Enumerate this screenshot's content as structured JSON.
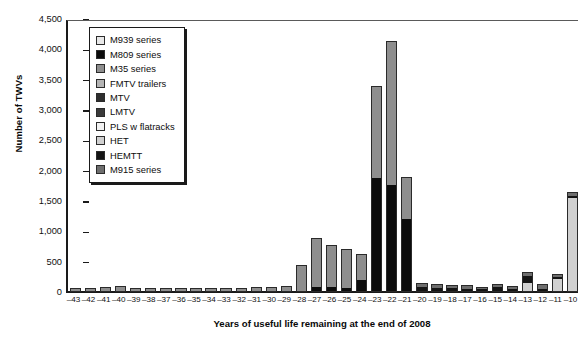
{
  "chart_data": {
    "type": "bar",
    "barmode": "stacked",
    "title": "",
    "xlabel": "Years of useful life remaining at the end of 2008",
    "ylabel": "Number of TWVs",
    "ylim": [
      0,
      4500
    ],
    "ytick_step": 500,
    "grid": false,
    "legend_position": "upper-left-inside",
    "ytick_labels": [
      "4,500",
      "4,000",
      "3,500",
      "3,000",
      "2,500",
      "2,000",
      "1,500",
      "1,000",
      "500",
      "0"
    ],
    "ytick_values": [
      4500,
      4000,
      3500,
      3000,
      2500,
      2000,
      1500,
      1000,
      500,
      0
    ],
    "categories": [
      "-43",
      "-42",
      "-41",
      "-40",
      "-39",
      "-38",
      "-37",
      "-36",
      "-35",
      "-34",
      "-33",
      "-32",
      "-31",
      "-30",
      "-29",
      "-28",
      "-27",
      "-26",
      "-25",
      "-24",
      "-23",
      "-22",
      "-21",
      "-20",
      "-19",
      "-18",
      "-17",
      "-16",
      "-15",
      "-14",
      "-13",
      "-12",
      "-11",
      "-10"
    ],
    "series": [
      {
        "name": "M939 series",
        "color": "#e8e8e8",
        "values": [
          0,
          0,
          0,
          0,
          0,
          0,
          0,
          0,
          0,
          0,
          0,
          0,
          0,
          0,
          0,
          0,
          0,
          0,
          0,
          0,
          0,
          0,
          0,
          0,
          0,
          0,
          0,
          0,
          0,
          0,
          0,
          0,
          0,
          0
        ]
      },
      {
        "name": "M809 series",
        "color": "#0c0c0c",
        "values": [
          0,
          0,
          0,
          0,
          0,
          0,
          0,
          0,
          0,
          0,
          0,
          0,
          0,
          0,
          0,
          0,
          60,
          60,
          50,
          180,
          1870,
          1740,
          1190,
          0,
          0,
          0,
          0,
          0,
          0,
          0,
          0,
          0,
          0,
          0
        ]
      },
      {
        "name": "M35 series",
        "color": "#8e8e8e",
        "values": [
          30,
          35,
          45,
          70,
          40,
          30,
          35,
          30,
          35,
          35,
          35,
          40,
          45,
          45,
          70,
          410,
          790,
          680,
          620,
          410,
          1500,
          2370,
          680,
          0,
          0,
          0,
          0,
          0,
          0,
          0,
          0,
          0,
          0,
          0
        ]
      },
      {
        "name": "FMTV trailers",
        "color": "#b4b4b4",
        "values": [
          0,
          0,
          0,
          0,
          0,
          0,
          0,
          0,
          0,
          0,
          0,
          0,
          0,
          0,
          0,
          0,
          0,
          0,
          0,
          0,
          0,
          0,
          0,
          0,
          0,
          0,
          0,
          0,
          0,
          0,
          0,
          0,
          0,
          0
        ]
      },
      {
        "name": "MTV",
        "color": "#2e2e2e",
        "values": [
          0,
          0,
          0,
          0,
          0,
          0,
          0,
          0,
          0,
          0,
          0,
          0,
          0,
          0,
          0,
          0,
          0,
          0,
          0,
          0,
          0,
          0,
          0,
          0,
          0,
          0,
          0,
          0,
          0,
          0,
          0,
          0,
          0,
          0
        ]
      },
      {
        "name": "LMTV",
        "color": "#3a3a3a",
        "values": [
          0,
          0,
          0,
          0,
          0,
          0,
          0,
          0,
          0,
          0,
          0,
          0,
          0,
          0,
          0,
          0,
          0,
          0,
          0,
          0,
          0,
          0,
          0,
          0,
          0,
          0,
          0,
          0,
          0,
          0,
          0,
          0,
          0,
          0
        ]
      },
      {
        "name": "PLS w flatracks",
        "color": "#f2f2f2",
        "values": [
          0,
          0,
          0,
          0,
          0,
          0,
          0,
          0,
          0,
          0,
          0,
          0,
          0,
          0,
          0,
          0,
          0,
          0,
          0,
          0,
          0,
          0,
          0,
          0,
          0,
          0,
          0,
          0,
          0,
          0,
          0,
          0,
          0,
          0
        ]
      },
      {
        "name": "HET",
        "color": "#d0d0d0",
        "values": [
          0,
          0,
          0,
          0,
          0,
          0,
          0,
          0,
          0,
          0,
          0,
          0,
          0,
          0,
          0,
          0,
          0,
          0,
          0,
          0,
          0,
          0,
          0,
          0,
          0,
          0,
          0,
          0,
          0,
          0,
          140,
          0,
          200,
          1530
        ]
      },
      {
        "name": "HEMTT",
        "color": "#141414",
        "values": [
          0,
          0,
          0,
          0,
          0,
          0,
          0,
          0,
          0,
          0,
          0,
          0,
          0,
          0,
          0,
          0,
          0,
          0,
          0,
          0,
          0,
          0,
          0,
          60,
          45,
          45,
          35,
          25,
          70,
          35,
          115,
          40,
          25,
          30
        ]
      },
      {
        "name": "M915 series",
        "color": "#6e6e6e",
        "values": [
          0,
          0,
          0,
          0,
          0,
          0,
          0,
          0,
          0,
          0,
          0,
          0,
          0,
          0,
          0,
          0,
          0,
          0,
          0,
          0,
          0,
          0,
          0,
          60,
          50,
          45,
          40,
          30,
          25,
          30,
          50,
          55,
          35,
          50
        ]
      }
    ],
    "legend_entries": [
      {
        "label": "M939 series",
        "color": "#e8e8e8"
      },
      {
        "label": "M809 series",
        "color": "#0c0c0c"
      },
      {
        "label": "M35 series",
        "color": "#8e8e8e"
      },
      {
        "label": "FMTV trailers",
        "color": "#b4b4b4"
      },
      {
        "label": "MTV",
        "color": "#2e2e2e"
      },
      {
        "label": "LMTV",
        "color": "#3a3a3a"
      },
      {
        "label": "PLS w flatracks",
        "color": "#f2f2f2"
      },
      {
        "label": "HET",
        "color": "#d0d0d0"
      },
      {
        "label": "HEMTT",
        "color": "#141414"
      },
      {
        "label": "M915 series",
        "color": "#6e6e6e"
      }
    ]
  }
}
